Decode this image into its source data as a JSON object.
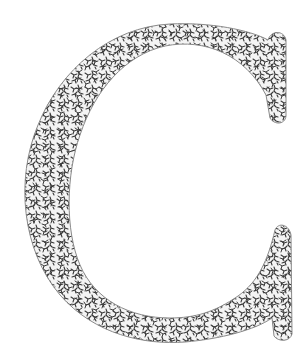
{
  "artwork": {
    "letter": "C",
    "description": "Decorative serif capital letter C with a dense maze-like fractal texture fill",
    "colors": {
      "background": "#ffffff",
      "outline": "#8a8a8a",
      "texture": "#3a3a3a",
      "fill": "#f4f4f4"
    }
  }
}
